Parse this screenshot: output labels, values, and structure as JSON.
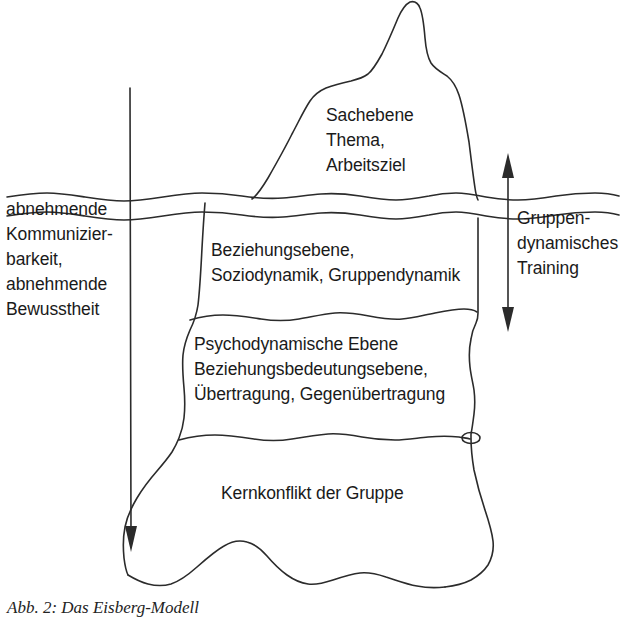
{
  "figure": {
    "caption": "Abb. 2: Das Eisberg-Modell",
    "left_axis": {
      "label": "abnehmende\nKommunizier-\nbarkeit,\nabnehmende\nBewusstheit",
      "arrow_direction": "down"
    },
    "right_axis": {
      "label": "Gruppen-\ndynamisches\nTraining",
      "arrow_direction": "both"
    },
    "layers": [
      {
        "id": "sachebene",
        "label": "Sachebene\nThema,\nArbeitsziel",
        "position": "above-waterline"
      },
      {
        "id": "beziehungsebene",
        "label": "Beziehungsebene,\nSoziodynamik, Gruppendynamik",
        "position": "below-waterline"
      },
      {
        "id": "psychodynamische-ebene",
        "label": "Psychodynamische Ebene\nBeziehungsbedeutungsebene,\nÜbertragung, Gegenübertragung",
        "position": "below-waterline"
      },
      {
        "id": "kernkonflikt",
        "label": "Kernkonflikt der Gruppe",
        "position": "below-waterline"
      }
    ],
    "colors": {
      "stroke": "#2b2b2b",
      "text": "#1a1a1a",
      "background": "#ffffff"
    }
  }
}
